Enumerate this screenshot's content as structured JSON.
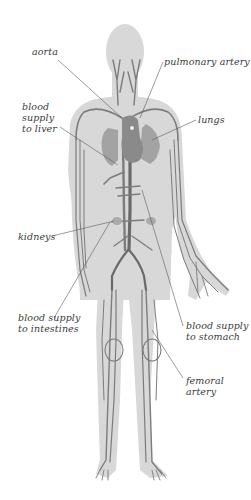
{
  "diagram": {
    "colors": {
      "background": "#ffffff",
      "body_silhouette": "#d8d8d8",
      "vessels": "#7c7c7c",
      "heart": "#8a8a8a",
      "label_text": "#3a3a3a",
      "leader_lines": "#5a5a5a"
    },
    "labels": {
      "aorta": "aorta",
      "pulmonary_artery": "pulmonary artery",
      "blood_supply_liver": "blood\nsupply\nto liver",
      "lungs": "lungs",
      "kidneys": "kidneys",
      "blood_supply_intestines": "blood supply\nto intestines",
      "blood_supply_stomach": "blood supply\nto stomach",
      "femoral_artery": "femoral\nartery"
    }
  }
}
